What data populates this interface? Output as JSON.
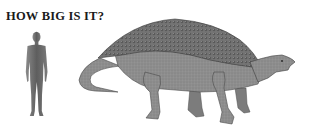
{
  "title": "HOW BIG IS IT?",
  "illustration": {
    "human": {
      "label": "human-silhouette",
      "color": "#6a6a6a"
    },
    "dinosaur": {
      "label": "armored-dinosaur",
      "body_color": "#8a8a8a",
      "armor_color": "#6f6f6f",
      "outline_color": "#3a3a3a"
    }
  }
}
